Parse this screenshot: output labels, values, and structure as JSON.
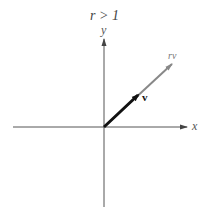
{
  "diagram": {
    "title": "r > 1",
    "axes": {
      "x_label": "x",
      "y_label": "y"
    },
    "vectors": [
      {
        "name": "v",
        "label": "v",
        "color": "#111111",
        "style": "bold"
      },
      {
        "name": "rv",
        "label": "rv",
        "color": "#888888",
        "style": "thin"
      }
    ]
  }
}
